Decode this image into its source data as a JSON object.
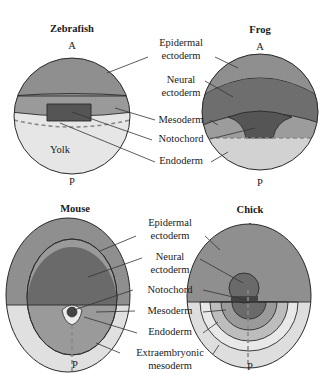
{
  "figure": {
    "panels": [
      {
        "title": "Zebrafish",
        "anterior": "A",
        "posterior": "P",
        "inner_label": "Yolk"
      },
      {
        "title": "Frog",
        "anterior": "A",
        "posterior": "P"
      },
      {
        "title": "Mouse",
        "anterior": "A",
        "posterior": "P"
      },
      {
        "title": "Chick",
        "anterior": "A",
        "posterior": "P"
      }
    ],
    "top_labels": {
      "epidermal_1": "Epidermal",
      "epidermal_2": "ectoderm",
      "neural_1": "Neural",
      "neural_2": "ectoderm",
      "mesoderm": "Mesoderm",
      "notochord": "Notochord",
      "endoderm": "Endoderm"
    },
    "bottom_labels": {
      "epidermal_1": "Epidermal",
      "epidermal_2": "ectoderm",
      "neural_1": "Neural",
      "neural_2": "ectoderm",
      "notochord": "Notochord",
      "mesoderm": "Mesoderm",
      "endoderm": "Endoderm",
      "extraembryonic_1": "Extraembryonic",
      "extraembryonic_2": "mesoderm"
    },
    "colors": {
      "epidermal": "#8f8f8f",
      "neural": "#6a6a6a",
      "notochord": "#4e4e4e",
      "mesoderm": "#9a9a9a",
      "endoderm": "#cfcfcf",
      "yolk": "#e6e6e6",
      "extraembryonic": "#e0e0e0"
    }
  }
}
